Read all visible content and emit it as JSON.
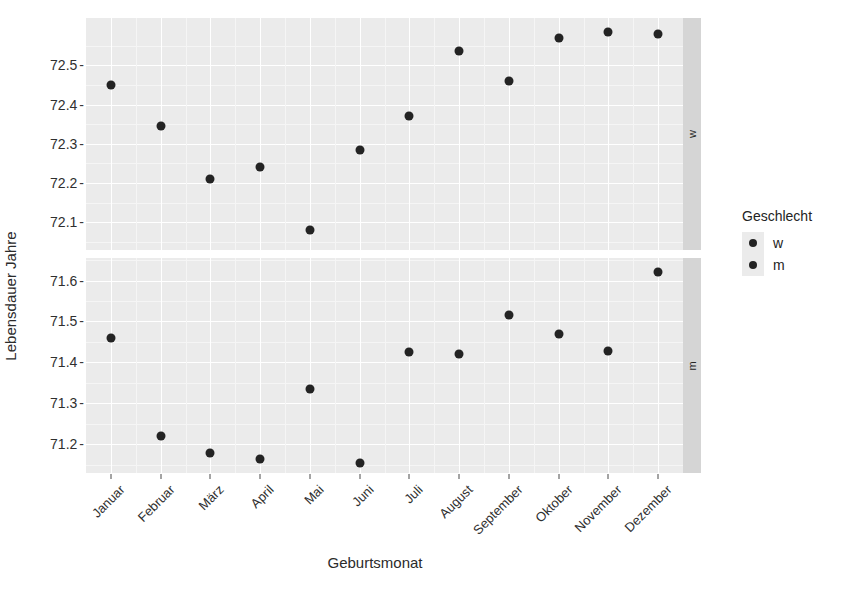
{
  "chart_data": {
    "type": "scatter",
    "title": "",
    "xlabel": "Geburtsmonat",
    "ylabel": "Lebensdauer Jahre",
    "grid": true,
    "legend_position": "right",
    "legend_title": "Geschlecht",
    "facet": "Geschlecht",
    "facet_levels": [
      "w",
      "m"
    ],
    "categories": [
      "Januar",
      "Februar",
      "März",
      "April",
      "Mai",
      "Juni",
      "Juli",
      "August",
      "September",
      "Oktober",
      "November",
      "Dezember"
    ],
    "series": [
      {
        "name": "w",
        "facet_label": "w",
        "legend_label": "w",
        "color": "#232323",
        "ylim": [
          72.03,
          72.62
        ],
        "yticks": [
          72.1,
          72.2,
          72.3,
          72.4,
          72.5
        ],
        "ytick_labels": [
          "72.1",
          "72.2",
          "72.3",
          "72.4",
          "72.5"
        ],
        "values": [
          72.45,
          72.345,
          72.21,
          72.24,
          72.08,
          72.285,
          72.37,
          72.535,
          72.46,
          72.57,
          72.585,
          72.58
        ]
      },
      {
        "name": "m",
        "facet_label": "m",
        "legend_label": "m",
        "color": "#232323",
        "ylim": [
          71.13,
          71.655
        ],
        "yticks": [
          71.2,
          71.3,
          71.4,
          71.5,
          71.6
        ],
        "ytick_labels": [
          "71.2",
          "71.3",
          "71.4",
          "71.5",
          "71.6"
        ],
        "values": [
          71.46,
          71.22,
          71.18,
          71.165,
          71.335,
          71.155,
          71.425,
          71.42,
          71.517,
          71.47,
          71.427,
          71.62
        ]
      }
    ]
  },
  "legend": {
    "title": "Geschlecht",
    "items": [
      {
        "label": "w"
      },
      {
        "label": "m"
      }
    ]
  },
  "axes": {
    "x_title": "Geburtsmonat",
    "y_title": "Lebensdauer Jahre"
  }
}
